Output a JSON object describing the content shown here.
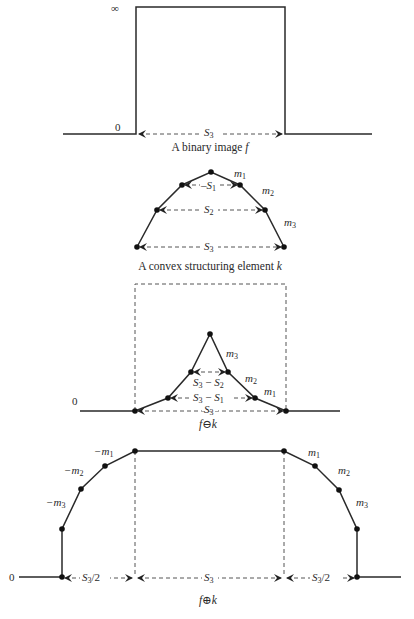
{
  "figure": {
    "panels": [
      {
        "id": "binary-image",
        "caption": "A binary image ",
        "caption_var": "f",
        "y_top_label": "∞",
        "y_zero_label": "0",
        "width_label_base": "S",
        "width_label_sub": "3"
      },
      {
        "id": "structuring-element",
        "caption": "A convex structuring element ",
        "caption_var": "k",
        "slopes": [
          {
            "base": "m",
            "sub": "1"
          },
          {
            "base": "m",
            "sub": "2"
          },
          {
            "base": "m",
            "sub": "3"
          }
        ],
        "widths": [
          {
            "base": "S",
            "sub": "1"
          },
          {
            "base": "S",
            "sub": "2"
          },
          {
            "base": "S",
            "sub": "3"
          }
        ]
      },
      {
        "id": "erosion",
        "caption": "f⊖k",
        "y_zero_label": "0",
        "slopes": [
          {
            "base": "m",
            "sub": "3"
          },
          {
            "base": "m",
            "sub": "2"
          },
          {
            "base": "m",
            "sub": "1"
          }
        ],
        "widths": [
          {
            "a": "S",
            "a_sub": "3",
            "op": " − ",
            "b": "S",
            "b_sub": "2"
          },
          {
            "a": "S",
            "a_sub": "3",
            "op": " − ",
            "b": "S",
            "b_sub": "1"
          },
          {
            "a": "S",
            "a_sub": "3"
          }
        ]
      },
      {
        "id": "dilation",
        "caption": "f⊕k",
        "y_zero_label": "0",
        "left_slopes": [
          {
            "base": "−m",
            "sub": "1"
          },
          {
            "base": "−m",
            "sub": "2"
          },
          {
            "base": "−m",
            "sub": "3"
          }
        ],
        "right_slopes": [
          {
            "base": "m",
            "sub": "1"
          },
          {
            "base": "m",
            "sub": "2"
          },
          {
            "base": "m",
            "sub": "3"
          }
        ],
        "widths": {
          "left": {
            "base": "S",
            "sub": "3",
            "suffix": "/2"
          },
          "middle": {
            "base": "S",
            "sub": "3",
            "suffix": ""
          },
          "right": {
            "base": "S",
            "sub": "3",
            "suffix": "/2"
          }
        }
      }
    ]
  }
}
